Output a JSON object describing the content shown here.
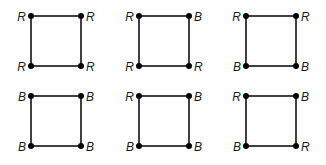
{
  "diagram": {
    "type": "vertex-colorings-of-square",
    "squares": [
      {
        "id": 1,
        "row": 0,
        "col": 0,
        "x": 31,
        "y": 16,
        "size": 50,
        "tl": "R",
        "tr": "R",
        "bl": "R",
        "br": "R"
      },
      {
        "id": 2,
        "row": 0,
        "col": 1,
        "x": 139,
        "y": 16,
        "size": 50,
        "tl": "R",
        "tr": "B",
        "bl": "R",
        "br": "R"
      },
      {
        "id": 3,
        "row": 0,
        "col": 2,
        "x": 246,
        "y": 16,
        "size": 50,
        "tl": "R",
        "tr": "R",
        "bl": "B",
        "br": "B"
      },
      {
        "id": 4,
        "row": 1,
        "col": 0,
        "x": 31,
        "y": 96,
        "size": 50,
        "tl": "B",
        "tr": "B",
        "bl": "B",
        "br": "B"
      },
      {
        "id": 5,
        "row": 1,
        "col": 1,
        "x": 139,
        "y": 96,
        "size": 50,
        "tl": "R",
        "tr": "B",
        "bl": "B",
        "br": "B"
      },
      {
        "id": 6,
        "row": 1,
        "col": 2,
        "x": 246,
        "y": 96,
        "size": 50,
        "tl": "R",
        "tr": "B",
        "bl": "B",
        "br": "R"
      }
    ]
  }
}
